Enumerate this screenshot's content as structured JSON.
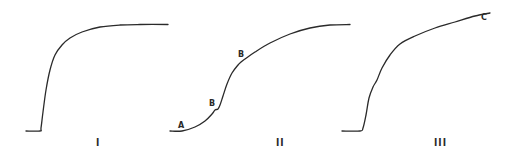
{
  "chart_data": [
    {
      "type": "line",
      "panel_label": "I",
      "title": "",
      "xlabel": "",
      "ylabel": "",
      "grid": false,
      "points": [
        [
          26,
          131
        ],
        [
          40,
          131
        ],
        [
          41,
          128
        ],
        [
          43,
          112
        ],
        [
          46,
          90
        ],
        [
          50,
          70
        ],
        [
          55,
          55
        ],
        [
          62,
          45
        ],
        [
          70,
          38
        ],
        [
          82,
          32
        ],
        [
          100,
          27
        ],
        [
          120,
          25
        ],
        [
          140,
          24.5
        ],
        [
          168,
          24.5
        ]
      ],
      "annotations": []
    },
    {
      "type": "line",
      "panel_label": "II",
      "title": "",
      "xlabel": "",
      "ylabel": "",
      "grid": false,
      "points": [
        [
          170,
          131
        ],
        [
          182,
          131
        ],
        [
          195,
          127
        ],
        [
          205,
          121
        ],
        [
          212,
          114
        ],
        [
          215,
          110
        ],
        [
          218,
          109
        ],
        [
          220,
          105
        ],
        [
          223,
          96
        ],
        [
          227,
          84
        ],
        [
          232,
          73
        ],
        [
          238,
          65
        ],
        [
          241,
          62
        ],
        [
          245,
          59
        ],
        [
          255,
          52
        ],
        [
          270,
          43
        ],
        [
          290,
          34
        ],
        [
          310,
          28
        ],
        [
          330,
          25
        ],
        [
          350,
          24.5
        ]
      ],
      "annotations": [
        {
          "text": "A",
          "x": 181,
          "y": 126
        },
        {
          "text": "B",
          "x": 213,
          "y": 104
        },
        {
          "text": "B",
          "x": 242,
          "y": 55
        }
      ]
    },
    {
      "type": "line",
      "panel_label": "III",
      "title": "",
      "xlabel": "",
      "ylabel": "",
      "grid": false,
      "points": [
        [
          342,
          131
        ],
        [
          360,
          131
        ],
        [
          363,
          128
        ],
        [
          366,
          115
        ],
        [
          369,
          98
        ],
        [
          373,
          87
        ],
        [
          377,
          80
        ],
        [
          382,
          68
        ],
        [
          390,
          55
        ],
        [
          400,
          44
        ],
        [
          415,
          36
        ],
        [
          435,
          28
        ],
        [
          455,
          22
        ],
        [
          475,
          16
        ],
        [
          490,
          13
        ]
      ],
      "annotations": [
        {
          "text": "C",
          "x": 482,
          "y": 19
        }
      ]
    }
  ],
  "labels": {
    "panel_1": "I",
    "panel_2": "II",
    "panel_3": "III",
    "point_a": "A",
    "point_b1": "B",
    "point_b2": "B",
    "point_c": "C"
  },
  "colors": {
    "line": "#2a2a2a",
    "background": "#ffffff"
  }
}
